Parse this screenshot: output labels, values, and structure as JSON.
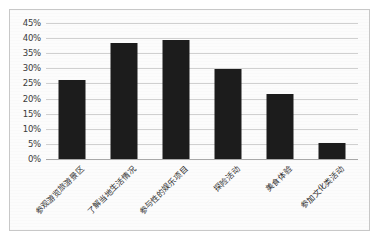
{
  "chart_data": {
    "type": "bar",
    "title": "",
    "subtitle": "",
    "xlabel": "",
    "ylabel": "",
    "ylim": [
      0,
      45
    ],
    "ytick_labels": [
      "45%",
      "40%",
      "35%",
      "30%",
      "25%",
      "20%",
      "15%",
      "10%",
      "5%",
      "0%"
    ],
    "ytick_values": [
      45,
      40,
      35,
      30,
      25,
      20,
      15,
      10,
      5,
      0
    ],
    "grid": "horizontal",
    "legend": "none",
    "bar_color": "#1c1c1c",
    "categories": [
      "参观游览旅游景区",
      "了解当地生活情况",
      "参与性的娱乐项目",
      "探险活动",
      "美食体验",
      "参加文化类活动"
    ],
    "values": [
      26.0,
      38.5,
      39.5,
      29.8,
      21.4,
      5.4
    ],
    "value_labels": [
      "26%",
      "38.5%",
      "39.5%",
      "29.8%",
      "21.4%",
      "5.4%"
    ],
    "value_labels_shown": false
  },
  "figure": {
    "border_color": "#c8c8c8",
    "background_color": "#fcfcfc"
  }
}
